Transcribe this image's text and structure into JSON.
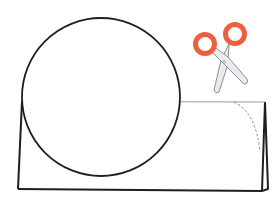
{
  "diagram": {
    "colors": {
      "background": "#ffffff",
      "outline": "#1f1f1f",
      "fold_line": "#9a9a9a",
      "cut_line": "#8a8a8a",
      "scissor_handle": "#EE5F3E",
      "scissor_blade": "#E9EBED",
      "scissor_blade_outline": "#8c9096"
    },
    "circle": {
      "cx": 101,
      "cy": 97,
      "r": 79
    },
    "card": {
      "front_top_left": [
        22,
        101
      ],
      "front_bottom_left": [
        18,
        189
      ],
      "front_bottom_right": [
        262,
        191
      ],
      "top_right": [
        265,
        102
      ],
      "back_leg_bottom": [
        268,
        189
      ]
    },
    "cut_line": {
      "start": [
        234,
        102
      ],
      "end": [
        260,
        152
      ],
      "style": "dashed"
    },
    "scissors": {
      "left_handle": {
        "cx": 205,
        "cy": 44,
        "r_outer": 12,
        "r_inner": 7
      },
      "right_handle": {
        "cx": 235,
        "cy": 34,
        "r_outer": 12,
        "r_inner": 7
      },
      "pivot": [
        224,
        62
      ]
    }
  }
}
